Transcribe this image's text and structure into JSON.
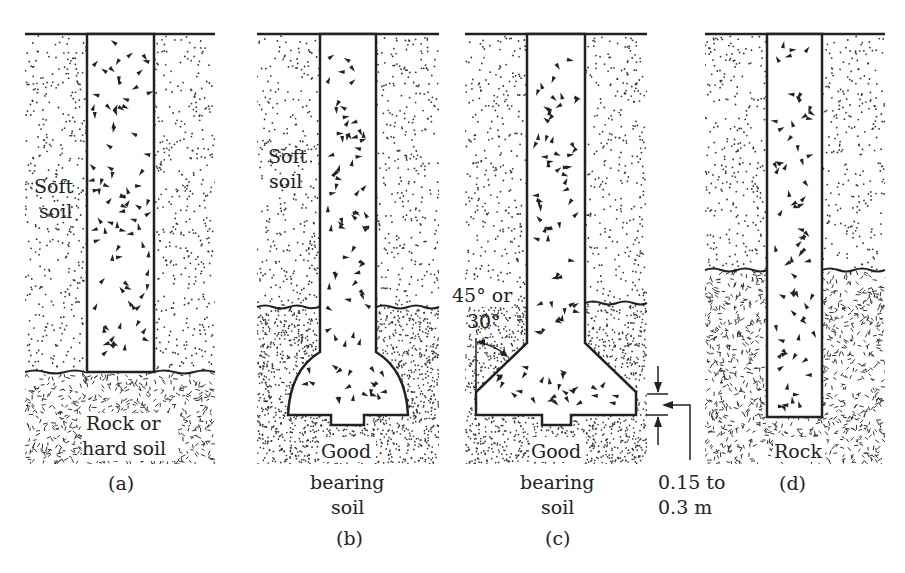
{
  "figure": {
    "panels": [
      {
        "id": "a",
        "caption": "(a)",
        "upper_layer_label": [
          "Soft",
          "soil"
        ],
        "lower_layer_label": [
          "Rock or",
          "hard soil"
        ],
        "pier_type": "straight shaft resting on rock"
      },
      {
        "id": "b",
        "caption": "(b)",
        "upper_layer_label": [
          "Soft",
          "soil"
        ],
        "lower_layer_label": [
          "Good",
          "bearing",
          "soil"
        ],
        "pier_type": "belled (dome) base"
      },
      {
        "id": "c",
        "caption": "(c)",
        "angle_label": [
          "45° or",
          "30°"
        ],
        "lower_layer_label": [
          "Good",
          "bearing",
          "soil"
        ],
        "dimension_label": [
          "0.15 to",
          "0.3 m"
        ],
        "pier_type": "belled (angled) base"
      },
      {
        "id": "d",
        "caption": "(d)",
        "lower_layer_label": [
          "Rock"
        ],
        "pier_type": "socketed into rock"
      }
    ]
  }
}
